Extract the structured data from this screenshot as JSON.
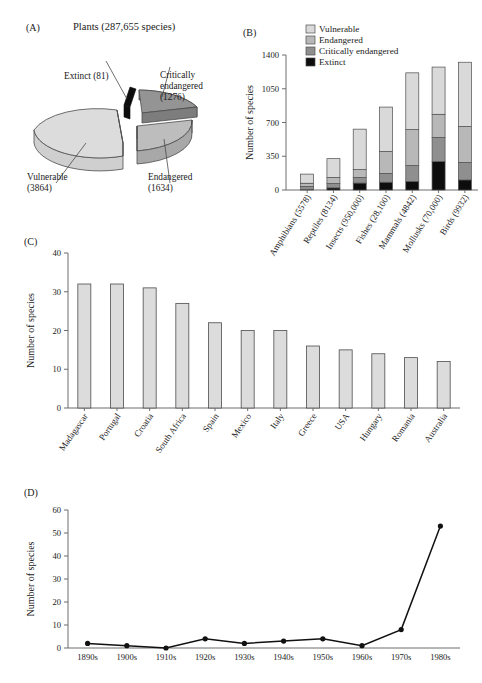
{
  "figure": {
    "panels": [
      "(A)",
      "(B)",
      "(C)",
      "(D)"
    ],
    "y_axis_label": "Number of species"
  },
  "colors": {
    "vulnerable": "#d9d9d9",
    "endangered": "#b8b8b8",
    "critically_endangered": "#8f8f8f",
    "extinct": "#0d0d0d",
    "bar_fill": "#dcdcdc",
    "outline": "#4d4d4d",
    "axis": "#6d6d6d",
    "background": "#ffffff"
  },
  "panelA": {
    "letter": "(A)",
    "title": "Plants (287,655 species)",
    "chart_data": {
      "type": "pie",
      "title": "Plants (287,655 species)",
      "labels": [
        "Vulnerable",
        "Endangered",
        "Critically endangered",
        "Extinct"
      ],
      "values": [
        3864,
        1634,
        1276,
        81
      ],
      "total": 6855,
      "annotations": [
        {
          "label": "Extinct (81)",
          "line1": "Extinct (81)",
          "line2": ""
        },
        {
          "label": "Critically endangered (1276)",
          "line1": "Critically",
          "line2": "endangered",
          "line3": "(1276)"
        },
        {
          "label": "Vulnerable (3864)",
          "line1": "Vulnerable",
          "line2": "(3864)"
        },
        {
          "label": "Endangered (1634)",
          "line1": "Endangered",
          "line2": "(1634)"
        }
      ],
      "exploded": true,
      "three_d": true
    }
  },
  "panelB": {
    "letter": "(B)",
    "ylabel": "Number of species",
    "legend": [
      "Vulnerable",
      "Endangered",
      "Critically endangered",
      "Extinct"
    ],
    "chart_data": {
      "type": "bar",
      "stacked": true,
      "ylabel": "Number of species",
      "xlabel": "",
      "ylim": [
        0,
        1400
      ],
      "yticks": [
        0,
        350,
        700,
        1050,
        1400
      ],
      "ytick_labels": [
        "0",
        "350",
        "700",
        "1050",
        "1400"
      ],
      "grid": false,
      "legend_position": "top-right",
      "categories": [
        "Amphibians (5578)",
        "Reptiles (8134)",
        "Insects (950,000)",
        "Fishes (28,100)",
        "Mammals (4842)",
        "Mollusks (70,000)",
        "Birds (9932)"
      ],
      "series": [
        {
          "name": "Extinct",
          "values": [
            5,
            22,
            72,
            81,
            87,
            295,
            104
          ]
        },
        {
          "name": "Critically endangered",
          "values": [
            32,
            45,
            58,
            91,
            166,
            250,
            182
          ]
        },
        {
          "name": "Endangered",
          "values": [
            33,
            63,
            81,
            228,
            373,
            240,
            373
          ]
        },
        {
          "name": "Vulnerable",
          "values": [
            95,
            195,
            420,
            460,
            589,
            490,
            666
          ]
        }
      ],
      "totals": [
        165,
        325,
        631,
        860,
        1215,
        1275,
        1325
      ]
    }
  },
  "panelC": {
    "letter": "(C)",
    "ylabel": "Number of species",
    "chart_data": {
      "type": "bar",
      "stacked": false,
      "ylabel": "Number of species",
      "xlabel": "",
      "ylim": [
        0,
        40
      ],
      "yticks": [
        0,
        10,
        20,
        30,
        40
      ],
      "ytick_labels": [
        "0",
        "10",
        "20",
        "30",
        "40"
      ],
      "grid": false,
      "categories": [
        "Madagascar",
        "Portugal",
        "Croatia",
        "South Africa",
        "Spain",
        "Mexico",
        "Italy",
        "Greece",
        "USA",
        "Hungary",
        "Romania",
        "Australia"
      ],
      "values": [
        32,
        32,
        31,
        27,
        22,
        20,
        20,
        16,
        15,
        14,
        13,
        12
      ]
    }
  },
  "panelD": {
    "letter": "(D)",
    "ylabel": "Number of species",
    "chart_data": {
      "type": "line",
      "ylabel": "Number of species",
      "xlabel": "",
      "ylim": [
        0,
        60
      ],
      "yticks": [
        0,
        10,
        20,
        30,
        40,
        50,
        60
      ],
      "ytick_labels": [
        "0",
        "10",
        "20",
        "30",
        "40",
        "50",
        "60"
      ],
      "grid": false,
      "markers": "filled-circle",
      "categories": [
        "1890s",
        "1900s",
        "1910s",
        "1920s",
        "1930s",
        "1940s",
        "1950s",
        "1960s",
        "1970s",
        "1980s"
      ],
      "values": [
        2,
        1,
        0,
        4,
        2,
        3,
        4,
        1,
        8,
        53
      ]
    }
  }
}
